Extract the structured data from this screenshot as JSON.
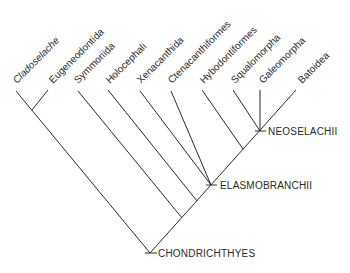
{
  "diagram": {
    "type": "cladogram",
    "root": "CHONDRICHTHYES",
    "taxa": [
      {
        "id": "cladoselache",
        "label": "Cladoselache",
        "italic": true
      },
      {
        "id": "eugeneodontida",
        "label": "Eugeneodontida",
        "italic": false
      },
      {
        "id": "symmoriida",
        "label": "Symmoriida",
        "italic": false
      },
      {
        "id": "holocephali",
        "label": "Holocephali",
        "italic": false
      },
      {
        "id": "xenacanthida",
        "label": "Xenacanthida",
        "italic": false
      },
      {
        "id": "ctenacanthiformes",
        "label": "Ctenacanthiformes",
        "italic": false
      },
      {
        "id": "hybodontiformes",
        "label": "Hybodontiformes",
        "italic": false
      },
      {
        "id": "squalomorpha",
        "label": "Squalomorpha",
        "italic": false
      },
      {
        "id": "galeomorpha",
        "label": "Galeomorpha",
        "italic": false
      },
      {
        "id": "batoidea",
        "label": "Batoidea",
        "italic": false
      }
    ],
    "clades": {
      "chondrichthyes": "CHONDRICHTHYES",
      "elasmobranchii": "ELASMOBRANCHII",
      "neoselachii": "NEOSELACHII"
    },
    "topology": "(((Cladoselache,Eugeneodontida),Symmoriida,Holocephali,(Xenacanthida,Ctenacanthiformes,(Hybodontiformes,(Squalomorpha,Galeomorpha,Batoidea)NEOSELACHII))ELASMOBRANCHII)CHONDRICHTHYES)"
  }
}
